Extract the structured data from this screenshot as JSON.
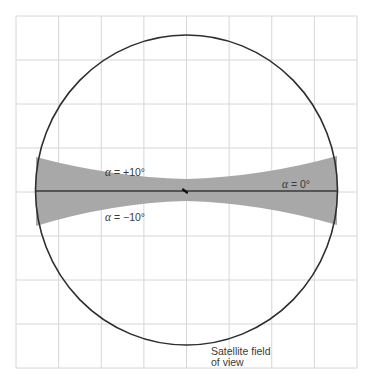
{
  "diagram": {
    "colors": {
      "background": "#ffffff",
      "grid": "#d6d6d6",
      "circle": "#2e2e2e",
      "band_fill": "#a8a8a8",
      "axis_line": "#3a3a3a",
      "text": "#3a3a3a"
    },
    "grid": {
      "x0": 16,
      "x1": 357,
      "y0": 16,
      "y1": 368,
      "columns": 8,
      "rows": 8
    },
    "circle": {
      "cx": 186.5,
      "cy": 190,
      "rx": 151,
      "ry": 155
    },
    "band": {
      "left_x": 36,
      "right_x": 337,
      "left_top": 157,
      "left_bottom": 226,
      "right_top": 156,
      "right_bottom": 225,
      "center_x": 186,
      "center_top": 179,
      "center_bottom": 201
    },
    "axis_line": {
      "y": 191
    },
    "center_mark": {
      "x": 185,
      "y": 191
    },
    "labels": {
      "alpha_plus": {
        "symbol": "α",
        "text": " = +10°",
        "x": 105,
        "y": 176
      },
      "alpha_minus": {
        "symbol": "α",
        "text": " = −10°",
        "x": 105,
        "y": 221
      },
      "alpha_zero": {
        "symbol": "α",
        "text": " = 0°",
        "x": 282,
        "y": 188
      },
      "fov_line1": {
        "text": "Satellite field",
        "x": 211,
        "y": 355
      },
      "fov_line2": {
        "text": "of view",
        "x": 211,
        "y": 366
      }
    }
  }
}
